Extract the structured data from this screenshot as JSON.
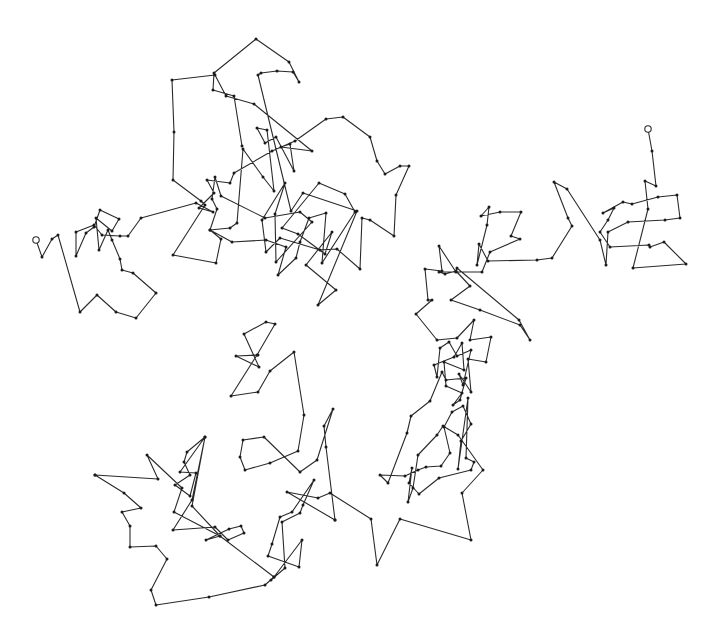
{
  "diagram": {
    "type": "random-walk",
    "stroke_color": "#2a2a2a",
    "vertex_color": "#1a1a1a",
    "background": "#ffffff",
    "start_point": [
      36,
      240
    ],
    "end_point": [
      648,
      129
    ],
    "path": [
      [
        36,
        240
      ],
      [
        42,
        257
      ],
      [
        52,
        239
      ],
      [
        58,
        235
      ],
      [
        80,
        312
      ],
      [
        97,
        295
      ],
      [
        116,
        312
      ],
      [
        136,
        318
      ],
      [
        156,
        293
      ],
      [
        133,
        273
      ],
      [
        122,
        270
      ],
      [
        120,
        259
      ],
      [
        112,
        240
      ],
      [
        108,
        230
      ],
      [
        99,
        250
      ],
      [
        96,
        218
      ],
      [
        112,
        231
      ],
      [
        119,
        219
      ],
      [
        100,
        210
      ],
      [
        94,
        227
      ],
      [
        86,
        233
      ],
      [
        76,
        256
      ],
      [
        76,
        232
      ],
      [
        94,
        225
      ],
      [
        102,
        235
      ],
      [
        120,
        236
      ],
      [
        128,
        236
      ],
      [
        141,
        218
      ],
      [
        196,
        203
      ],
      [
        213,
        212
      ],
      [
        199,
        208
      ],
      [
        214,
        193
      ],
      [
        207,
        180
      ],
      [
        230,
        183
      ],
      [
        234,
        173
      ],
      [
        272,
        151
      ],
      [
        295,
        141
      ],
      [
        326,
        119
      ],
      [
        343,
        117
      ],
      [
        370,
        137
      ],
      [
        377,
        161
      ],
      [
        385,
        174
      ],
      [
        400,
        166
      ],
      [
        409,
        166
      ],
      [
        396,
        195
      ],
      [
        394,
        236
      ],
      [
        370,
        220
      ],
      [
        362,
        218
      ],
      [
        360,
        269
      ],
      [
        337,
        249
      ],
      [
        320,
        250
      ],
      [
        280,
        238
      ],
      [
        266,
        252
      ],
      [
        262,
        220
      ],
      [
        285,
        183
      ],
      [
        275,
        214
      ],
      [
        276,
        262
      ],
      [
        312,
        222
      ],
      [
        300,
        212
      ],
      [
        265,
        218
      ],
      [
        221,
        196
      ],
      [
        215,
        177
      ],
      [
        212,
        199
      ],
      [
        217,
        209
      ],
      [
        210,
        230
      ],
      [
        230,
        228
      ],
      [
        237,
        223
      ],
      [
        243,
        149
      ],
      [
        263,
        177
      ],
      [
        274,
        191
      ],
      [
        267,
        130
      ],
      [
        257,
        128
      ],
      [
        265,
        143
      ],
      [
        276,
        137
      ],
      [
        294,
        171
      ],
      [
        290,
        144
      ],
      [
        281,
        147
      ],
      [
        312,
        151
      ],
      [
        254,
        104
      ],
      [
        226,
        96
      ],
      [
        215,
        75
      ],
      [
        172,
        80
      ],
      [
        174,
        132
      ],
      [
        173,
        180
      ],
      [
        201,
        201
      ],
      [
        205,
        205
      ],
      [
        173,
        255
      ],
      [
        216,
        263
      ],
      [
        221,
        239
      ],
      [
        210,
        230
      ],
      [
        232,
        242
      ],
      [
        266,
        240
      ],
      [
        286,
        247
      ],
      [
        278,
        275
      ],
      [
        296,
        258
      ],
      [
        300,
        242
      ],
      [
        309,
        218
      ],
      [
        326,
        213
      ],
      [
        322,
        263
      ],
      [
        355,
        212
      ],
      [
        345,
        194
      ],
      [
        319,
        183
      ],
      [
        282,
        228
      ],
      [
        298,
        234
      ],
      [
        325,
        254
      ],
      [
        332,
        232
      ],
      [
        306,
        265
      ],
      [
        336,
        290
      ],
      [
        318,
        305
      ],
      [
        357,
        211
      ],
      [
        303,
        193
      ],
      [
        291,
        211
      ],
      [
        258,
        75
      ],
      [
        261,
        73
      ],
      [
        277,
        71
      ],
      [
        293,
        72
      ],
      [
        299,
        82
      ],
      [
        289,
        62
      ],
      [
        256,
        39
      ],
      [
        214,
        73
      ],
      [
        213,
        90
      ],
      [
        234,
        96
      ],
      [
        242,
        146
      ]
    ],
    "path_right": [
      [
        648,
        129
      ],
      [
        652,
        151
      ],
      [
        656,
        186
      ],
      [
        645,
        181
      ],
      [
        648,
        209
      ],
      [
        633,
        268
      ],
      [
        686,
        264
      ],
      [
        664,
        242
      ],
      [
        650,
        247
      ],
      [
        649,
        245
      ],
      [
        610,
        247
      ],
      [
        600,
        232
      ],
      [
        608,
        220
      ],
      [
        614,
        208
      ],
      [
        603,
        213
      ],
      [
        623,
        202
      ],
      [
        632,
        204
      ],
      [
        658,
        197
      ],
      [
        677,
        195
      ],
      [
        680,
        218
      ],
      [
        665,
        220
      ],
      [
        628,
        222
      ],
      [
        608,
        232
      ],
      [
        606,
        265
      ],
      [
        600,
        240
      ],
      [
        567,
        189
      ],
      [
        554,
        182
      ],
      [
        568,
        218
      ],
      [
        572,
        226
      ],
      [
        552,
        258
      ],
      [
        537,
        260
      ],
      [
        488,
        261
      ],
      [
        479,
        244
      ],
      [
        477,
        265
      ],
      [
        487,
        225
      ],
      [
        489,
        207
      ],
      [
        481,
        216
      ],
      [
        500,
        212
      ],
      [
        521,
        212
      ],
      [
        511,
        236
      ],
      [
        520,
        239
      ],
      [
        490,
        252
      ],
      [
        482,
        272
      ],
      [
        439,
        272
      ],
      [
        445,
        274
      ],
      [
        456,
        271
      ],
      [
        470,
        286
      ],
      [
        451,
        300
      ],
      [
        480,
        310
      ],
      [
        520,
        325
      ],
      [
        530,
        340
      ],
      [
        519,
        320
      ],
      [
        457,
        268
      ],
      [
        456,
        272
      ],
      [
        439,
        246
      ],
      [
        442,
        271
      ],
      [
        425,
        269
      ],
      [
        428,
        300
      ],
      [
        432,
        300
      ],
      [
        416,
        314
      ],
      [
        437,
        340
      ],
      [
        457,
        338
      ],
      [
        474,
        320
      ],
      [
        470,
        340
      ],
      [
        491,
        337
      ],
      [
        486,
        362
      ],
      [
        468,
        359
      ],
      [
        471,
        392
      ],
      [
        459,
        374
      ],
      [
        463,
        385
      ],
      [
        471,
        350
      ],
      [
        457,
        356
      ],
      [
        449,
        342
      ],
      [
        440,
        348
      ],
      [
        437,
        377
      ],
      [
        434,
        365
      ],
      [
        454,
        357
      ],
      [
        462,
        343
      ],
      [
        464,
        370
      ],
      [
        444,
        362
      ],
      [
        446,
        386
      ],
      [
        462,
        393
      ],
      [
        453,
        405
      ],
      [
        460,
        400
      ],
      [
        466,
        378
      ],
      [
        446,
        380
      ],
      [
        442,
        372
      ],
      [
        430,
        401
      ],
      [
        411,
        416
      ],
      [
        407,
        433
      ],
      [
        388,
        483
      ],
      [
        380,
        475
      ],
      [
        405,
        476
      ],
      [
        418,
        470
      ],
      [
        426,
        467
      ],
      [
        441,
        466
      ],
      [
        450,
        453
      ],
      [
        444,
        427
      ],
      [
        452,
        412
      ],
      [
        463,
        406
      ],
      [
        471,
        424
      ],
      [
        461,
        441
      ],
      [
        458,
        469
      ],
      [
        468,
        398
      ],
      [
        466,
        458
      ],
      [
        474,
        462
      ],
      [
        471,
        470
      ],
      [
        439,
        478
      ],
      [
        419,
        494
      ],
      [
        409,
        483
      ],
      [
        412,
        468
      ],
      [
        408,
        502
      ],
      [
        413,
        488
      ],
      [
        418,
        455
      ],
      [
        437,
        435
      ],
      [
        443,
        426
      ],
      [
        458,
        435
      ],
      [
        483,
        470
      ],
      [
        462,
        493
      ],
      [
        471,
        540
      ],
      [
        400,
        519
      ],
      [
        377,
        565
      ],
      [
        371,
        519
      ],
      [
        330,
        493
      ],
      [
        318,
        498
      ],
      [
        287,
        492
      ],
      [
        335,
        520
      ]
    ],
    "path_bottom": [
      [
        335,
        520
      ],
      [
        326,
        447
      ],
      [
        324,
        426
      ],
      [
        333,
        409
      ],
      [
        317,
        460
      ],
      [
        300,
        472
      ],
      [
        264,
        437
      ],
      [
        243,
        440
      ],
      [
        240,
        457
      ],
      [
        245,
        470
      ],
      [
        270,
        463
      ],
      [
        298,
        451
      ],
      [
        304,
        415
      ],
      [
        294,
        352
      ],
      [
        270,
        371
      ],
      [
        258,
        392
      ],
      [
        231,
        396
      ],
      [
        257,
        355
      ],
      [
        275,
        324
      ],
      [
        266,
        322
      ],
      [
        244,
        334
      ],
      [
        259,
        367
      ],
      [
        236,
        356
      ],
      [
        258,
        355
      ]
    ],
    "path_lower_left": [
      [
        95,
        475
      ],
      [
        158,
        479
      ],
      [
        147,
        455
      ],
      [
        182,
        488
      ],
      [
        174,
        512
      ],
      [
        220,
        536
      ],
      [
        206,
        540
      ],
      [
        229,
        529
      ],
      [
        241,
        526
      ],
      [
        244,
        533
      ],
      [
        228,
        540
      ],
      [
        215,
        527
      ],
      [
        173,
        530
      ],
      [
        192,
        500
      ],
      [
        205,
        437
      ],
      [
        187,
        452
      ],
      [
        184,
        462
      ],
      [
        190,
        475
      ],
      [
        175,
        485
      ],
      [
        190,
        496
      ],
      [
        196,
        473
      ],
      [
        180,
        472
      ],
      [
        205,
        437
      ],
      [
        192,
        506
      ],
      [
        220,
        536
      ],
      [
        274,
        577
      ],
      [
        271,
        580
      ],
      [
        285,
        568
      ],
      [
        282,
        522
      ],
      [
        300,
        513
      ],
      [
        303,
        505
      ],
      [
        314,
        480
      ],
      [
        292,
        512
      ],
      [
        280,
        517
      ],
      [
        272,
        544
      ],
      [
        268,
        556
      ],
      [
        299,
        567
      ],
      [
        302,
        540
      ],
      [
        274,
        577
      ],
      [
        265,
        585
      ],
      [
        209,
        597
      ],
      [
        156,
        605
      ],
      [
        151,
        590
      ],
      [
        167,
        559
      ],
      [
        156,
        546
      ],
      [
        130,
        547
      ],
      [
        130,
        526
      ],
      [
        122,
        512
      ],
      [
        141,
        508
      ],
      [
        124,
        493
      ],
      [
        95,
        475
      ]
    ]
  }
}
